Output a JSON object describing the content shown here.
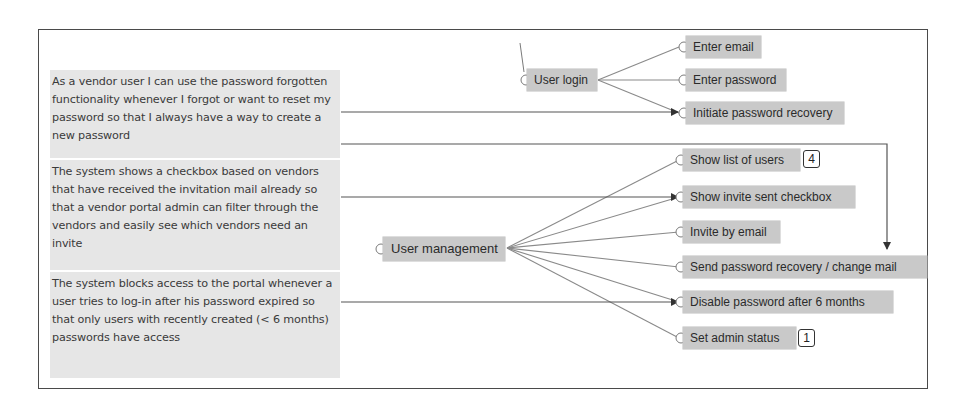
{
  "stories": [
    {
      "id": "story-password-recovery",
      "text": "As a vendor user I can use the password forgotten functionality whenever I forgot or want to reset my password so that I always have a way to create a new password"
    },
    {
      "id": "story-invite-checkbox",
      "text": "The system shows a checkbox based on vendors that have received the invitation mail already so that a vendor portal admin can filter through the vendors and easily see which vendors need an invite"
    },
    {
      "id": "story-password-expiry",
      "text": "The system blocks access to the portal whenever a user tries to log-in after his password expired so that only users with recently created (< 6 months) passwords have access"
    }
  ],
  "tree": {
    "user_login": {
      "label": "User login",
      "children": [
        {
          "label": "Enter email"
        },
        {
          "label": "Enter password"
        },
        {
          "label": "Initiate password recovery"
        }
      ]
    },
    "user_management": {
      "label": "User management",
      "children": [
        {
          "label": "Show list of users",
          "badge": "4"
        },
        {
          "label": "Show invite sent checkbox"
        },
        {
          "label": "Invite by email"
        },
        {
          "label": "Send password recovery / change mail"
        },
        {
          "label": "Disable password after 6 months"
        },
        {
          "label": "Set admin status",
          "badge": "1"
        }
      ]
    }
  },
  "links": [
    {
      "from": "story-password-recovery",
      "to": "Initiate password recovery"
    },
    {
      "from": "story-password-recovery",
      "to": "Send password recovery / change mail"
    },
    {
      "from": "story-invite-checkbox",
      "to": "Show invite sent checkbox"
    },
    {
      "from": "story-password-expiry",
      "to": "Disable password after 6 months"
    }
  ],
  "colors": {
    "node_fill": "#c9c9c9",
    "story_fill": "#e6e6e6",
    "line": "#7a7a7a",
    "arrow": "#333333",
    "frame": "#4a4a4a"
  }
}
